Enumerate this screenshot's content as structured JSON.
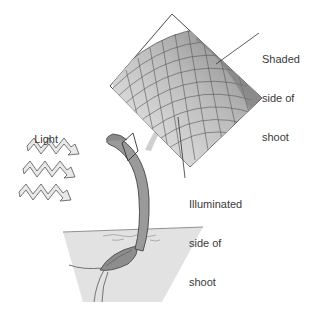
{
  "diagram": {
    "labels": {
      "light": "Light",
      "shaded_line1": "Shaded",
      "shaded_line2": "side of",
      "shaded_line3": "shoot",
      "illuminated_line1": "Illuminated",
      "illuminated_line2": "side of",
      "illuminated_line3": "shoot"
    },
    "elements": {
      "light_rays": 3,
      "inset": "magnified cell grid of shoot tip",
      "shoot": "curved seedling shoot bending toward light",
      "soil": "soil cross-section with seed and roots"
    },
    "colors": {
      "shaded_cells": "#8a8a8a",
      "illuminated_cells": "#e4e4e4",
      "soil": "#e2e2e2",
      "shoot": "#9a9a9a",
      "arrow": "#d0d0d0",
      "line": "#333333"
    }
  }
}
